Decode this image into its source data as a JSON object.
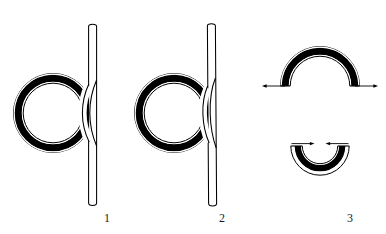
{
  "plate": {
    "title": "",
    "background_color": "#ffffff",
    "ink_color": "#000000",
    "width": 386,
    "height": 234
  },
  "captions": {
    "figure_1": "1",
    "figure_2": "2",
    "figure_3": "3"
  },
  "figures": [
    {
      "id": "figure-1",
      "caption": "1",
      "description": "Closed ring with thick black annulus crossed by a vertical rod at its right side",
      "parts": {
        "ring_label": "ring",
        "rod_label": "rod"
      },
      "geometry": {
        "ring_center_x": 53,
        "ring_center_y": 113,
        "ring_outer_radius": 39,
        "ring_inner_radius": 30,
        "rod_x": 93,
        "rod_top_y": 23,
        "rod_bottom_y": 208,
        "rod_width": 8
      }
    },
    {
      "id": "figure-2",
      "caption": "2",
      "description": "Closed ring with thick black annulus and a vertical rod tangent at its right side, ring shifted lower",
      "parts": {
        "ring_label": "ring",
        "rod_label": "rod"
      },
      "geometry": {
        "ring_center_x": 174,
        "ring_center_y": 113,
        "ring_outer_radius": 39,
        "ring_inner_radius": 30,
        "rod_x": 212,
        "rod_top_y": 23,
        "rod_bottom_y": 208,
        "rod_width": 8
      }
    },
    {
      "id": "figure-3",
      "caption": "3",
      "description": "Two open arcs: an upper inverted-U arc with arrows at both ends pointing outward, and a lower U arc with arrows at both ends pointing inward",
      "parts": {
        "upper_arc_label": "upper-arc",
        "lower_arc_label": "lower-arc",
        "arrow_left_upper": "arrow-left-outward",
        "arrow_right_upper": "arrow-right-outward",
        "arrow_left_lower": "arrow-left-inward",
        "arrow_right_lower": "arrow-right-inward"
      },
      "geometry": {
        "upper_center_x": 320,
        "upper_center_y": 86,
        "upper_outer_radius": 40,
        "upper_inner_radius": 31,
        "lower_center_x": 320,
        "lower_center_y": 146,
        "lower_outer_radius": 29,
        "lower_inner_radius": 21
      }
    }
  ]
}
